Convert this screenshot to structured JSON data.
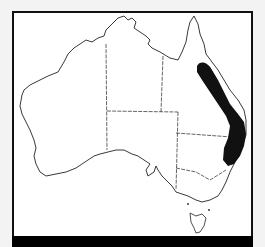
{
  "map": {
    "region": "Australia",
    "type": "species distribution map",
    "range_highlight": "eastern Queensland to northern New South Wales",
    "colors": {
      "background": "#f3f3f3",
      "map_fill": "#ffffff",
      "outline": "#222222",
      "range": "#111111",
      "caption_bar": "#000000"
    }
  },
  "caption": {
    "text": ""
  }
}
